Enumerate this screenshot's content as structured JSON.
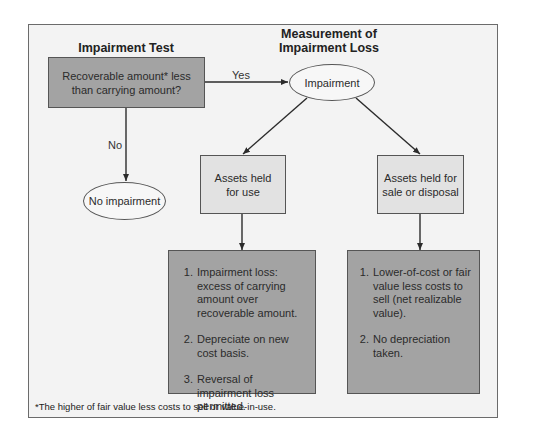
{
  "diagram": {
    "left_title": "Impairment Test",
    "right_title_line1": "Measurement of",
    "right_title_line2": "Impairment Loss",
    "decision": {
      "line1": "Recoverable amount* less",
      "line2": "than carrying amount?"
    },
    "yes_label": "Yes",
    "no_label": "No",
    "impairment_node": "Impairment",
    "no_impairment_node": "No impairment",
    "held_for_use": {
      "line1": "Assets held",
      "line2": "for use",
      "steps": [
        "Impairment loss: excess of carrying amount over recoverable amount.",
        "Depreciate on new cost basis.",
        "Reversal of impairment loss permitted."
      ]
    },
    "held_for_sale": {
      "line1": "Assets held for",
      "line2": "sale or disposal",
      "steps": [
        "Lower-of-cost or fair value less costs to sell (net realizable value).",
        "No depreciation taken."
      ]
    },
    "footnote": "*The higher of fair value less costs to sell or value-in-use."
  },
  "colors": {
    "frame_bg": "#f3f3f3",
    "dark_box": "#a3a3a3",
    "light_box": "#e2e2e2",
    "ellipse": "#f7f7f7",
    "line": "#2b2b2b"
  }
}
